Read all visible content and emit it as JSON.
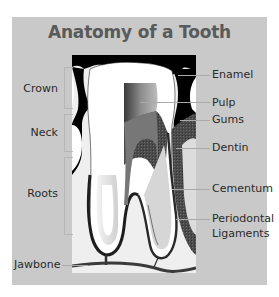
{
  "title": "Anatomy of a Tooth",
  "colors": {
    "panel": "#c9c9c9",
    "title": "#5a5a5a",
    "label": "#2a2a2a",
    "enamel": "#ffffff",
    "gums": "#4a4a4a",
    "pulp": "#7a7a7a",
    "background_dark": "#000000",
    "bone": "#f0f0f0"
  },
  "labels": {
    "left": [
      {
        "id": "crown",
        "text": "Crown"
      },
      {
        "id": "neck",
        "text": "Neck"
      },
      {
        "id": "roots",
        "text": "Roots"
      },
      {
        "id": "jawbone",
        "text": "Jawbone"
      }
    ],
    "right": [
      {
        "id": "enamel",
        "text": "Enamel"
      },
      {
        "id": "pulp",
        "text": "Pulp"
      },
      {
        "id": "gums",
        "text": "Gums"
      },
      {
        "id": "dentin",
        "text": "Dentin"
      },
      {
        "id": "cementum",
        "text": "Cementum"
      },
      {
        "id": "periodontal",
        "text": "Periodontal"
      },
      {
        "id": "ligaments",
        "text": "Ligaments"
      }
    ]
  }
}
